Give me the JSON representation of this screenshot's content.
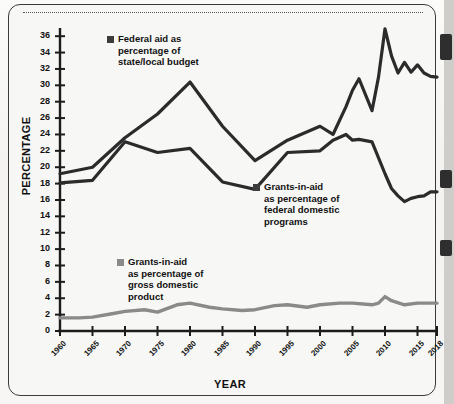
{
  "figure": {
    "y_axis_title": "PERCENTAGE",
    "x_axis_title": "YEAR"
  },
  "legend": {
    "federal": {
      "line1": "Federal aid as",
      "line2": "percentage of",
      "line3": "state/local budget",
      "swatch_color": "#3c3c3c"
    },
    "domestic": {
      "line1": "Grants-in-aid",
      "line2": "as percentage of",
      "line3": "federal domestic",
      "line4": "programs",
      "swatch_color": "#3c3c3c"
    },
    "gdp": {
      "line1": "Grants-in-aid",
      "line2": "as percentage of",
      "line3": "gross domestic",
      "line4": "product",
      "swatch_color": "#8a8a8a"
    }
  },
  "chart_data": {
    "type": "line",
    "title": "",
    "xlabel": "YEAR",
    "ylabel": "PERCENTAGE",
    "xlim": [
      1960,
      2018
    ],
    "ylim": [
      0,
      37
    ],
    "yticks": [
      0,
      2,
      4,
      6,
      8,
      10,
      12,
      14,
      16,
      18,
      20,
      22,
      24,
      26,
      28,
      30,
      32,
      34,
      36
    ],
    "xticks": [
      1960,
      1965,
      1970,
      1975,
      1980,
      1985,
      1990,
      1995,
      2000,
      2005,
      2010,
      2015,
      2018
    ],
    "grid": false,
    "legend_position": "inline-annotations",
    "series": [
      {
        "name": "Federal aid as percentage of state/local budget",
        "color": "#2b2b2b",
        "x": [
          1960,
          1965,
          1970,
          1975,
          1980,
          1985,
          1990,
          1995,
          2000,
          2002,
          2004,
          2005,
          2006,
          2008,
          2009,
          2010,
          2011,
          2012,
          2013,
          2014,
          2015,
          2016,
          2017,
          2018
        ],
        "y": [
          19.2,
          20.0,
          23.6,
          26.5,
          30.4,
          25.0,
          20.8,
          23.3,
          25.0,
          24.0,
          27.4,
          29.4,
          30.8,
          26.9,
          31.0,
          36.9,
          33.6,
          31.5,
          32.8,
          31.6,
          32.5,
          31.5,
          31.1,
          31.0
        ]
      },
      {
        "name": "Grants-in-aid as percentage of federal domestic programs",
        "color": "#2b2b2b",
        "x": [
          1960,
          1965,
          1970,
          1975,
          1980,
          1985,
          1990,
          1995,
          2000,
          2002,
          2004,
          2005,
          2006,
          2008,
          2010,
          2011,
          2012,
          2013,
          2014,
          2015,
          2016,
          2017,
          2018
        ],
        "y": [
          18.1,
          18.4,
          23.1,
          21.8,
          22.3,
          18.2,
          17.3,
          21.8,
          22.0,
          23.3,
          24.0,
          23.3,
          23.4,
          23.1,
          19.2,
          17.4,
          16.5,
          15.8,
          16.2,
          16.4,
          16.5,
          17.0,
          17.0
        ]
      },
      {
        "name": "Grants-in-aid as percentage of gross domestic product",
        "color": "#8a8a8a",
        "x": [
          1960,
          1963,
          1965,
          1968,
          1970,
          1973,
          1975,
          1978,
          1980,
          1983,
          1985,
          1988,
          1990,
          1993,
          1995,
          1998,
          2000,
          2003,
          2005,
          2008,
          2009,
          2010,
          2011,
          2013,
          2015,
          2018
        ],
        "y": [
          1.6,
          1.6,
          1.7,
          2.1,
          2.4,
          2.6,
          2.3,
          3.2,
          3.4,
          2.9,
          2.7,
          2.5,
          2.6,
          3.1,
          3.2,
          2.9,
          3.2,
          3.4,
          3.4,
          3.2,
          3.4,
          4.2,
          3.7,
          3.2,
          3.4,
          3.4
        ]
      }
    ]
  }
}
